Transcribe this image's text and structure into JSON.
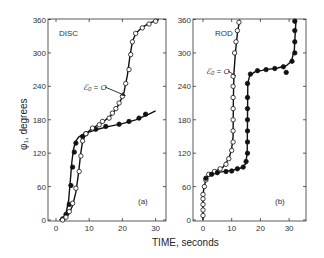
{
  "chart_data": [
    {
      "type": "line",
      "panel": "(a)",
      "title": "DISC",
      "annotation": "ℰ₀ = O",
      "xlabel": "TIME, seconds",
      "ylabel": "φ₁, degrees",
      "xlim": [
        0,
        33
      ],
      "ylim": [
        0,
        360
      ],
      "xticks": [
        0,
        10,
        20,
        30
      ],
      "yticks": [
        0,
        60,
        120,
        180,
        240,
        300,
        360
      ],
      "grid": false,
      "series": [
        {
          "name": "filled",
          "marker": "filled-circle",
          "x": [
            2,
            3,
            4,
            4.5,
            5,
            5.5,
            6,
            8,
            9,
            12,
            15,
            19,
            22,
            25,
            27
          ],
          "y": [
            2,
            10,
            28,
            62,
            95,
            122,
            138,
            150,
            155,
            163,
            168,
            172,
            177,
            183,
            190
          ],
          "curve_x": [
            1,
            2,
            3,
            3.8,
            4.3,
            4.8,
            5.3,
            6,
            7,
            9,
            12,
            16,
            20,
            24,
            28,
            30
          ],
          "curve_y": [
            0,
            3,
            12,
            35,
            70,
            105,
            128,
            142,
            150,
            156,
            162,
            168,
            173,
            180,
            190,
            196
          ]
        },
        {
          "name": "E0 = 0 (open)",
          "marker": "open-circle",
          "x": [
            2,
            3,
            4,
            5,
            6,
            7,
            7.5,
            8,
            9,
            11,
            13,
            14,
            16,
            17,
            18,
            19,
            20,
            21,
            22,
            22.5,
            23,
            24,
            26,
            28,
            30
          ],
          "y": [
            0,
            5,
            15,
            30,
            57,
            87,
            115,
            142,
            155,
            165,
            171,
            177,
            183,
            192,
            200,
            210,
            222,
            245,
            270,
            297,
            320,
            335,
            345,
            352,
            357
          ],
          "curve_x": [
            2,
            3,
            4,
            5,
            6,
            6.8,
            7.4,
            8,
            9,
            11,
            14,
            17,
            19,
            20.5,
            21.5,
            22.3,
            23,
            24,
            26,
            28,
            30,
            31
          ],
          "curve_y": [
            0,
            4,
            12,
            26,
            50,
            85,
            118,
            142,
            155,
            165,
            175,
            190,
            208,
            230,
            260,
            295,
            320,
            335,
            346,
            353,
            358,
            360
          ]
        }
      ]
    },
    {
      "type": "line",
      "panel": "(b)",
      "title": "ROD",
      "annotation": "ℰ₀ = O",
      "xlabel": "TIME, seconds",
      "ylabel": "",
      "xlim": [
        -3,
        36
      ],
      "ylim": [
        0,
        360
      ],
      "xticks": [
        0,
        10,
        20,
        30
      ],
      "yticks": [
        0,
        60,
        120,
        180,
        240,
        300,
        360
      ],
      "grid": false,
      "series": [
        {
          "name": "E0 = 0 (open)",
          "marker": "open-circle",
          "x": [
            0,
            0,
            0,
            0,
            0,
            0.5,
            1,
            2,
            4,
            6,
            8,
            9,
            10,
            10.5,
            10.5,
            10.5,
            10.5,
            10.5,
            10.5,
            10.5,
            11,
            11.5,
            12,
            12.5
          ],
          "y": [
            8,
            18,
            28,
            38,
            46,
            60,
            72,
            82,
            87,
            92,
            100,
            110,
            125,
            140,
            160,
            180,
            200,
            220,
            240,
            258,
            300,
            320,
            340,
            355
          ],
          "curve_x": [
            0,
            0,
            0.4,
            1,
            2,
            4,
            7,
            9,
            10,
            10.5,
            10.6,
            10.8,
            11.3,
            12,
            12.8
          ],
          "curve_y": [
            0,
            45,
            60,
            72,
            82,
            87,
            95,
            110,
            128,
            150,
            220,
            265,
            300,
            335,
            360
          ]
        },
        {
          "name": "filled",
          "marker": "filled-circle",
          "x": [
            1,
            3,
            5,
            8,
            10,
            12,
            14,
            15,
            15.5,
            15.5,
            15.5,
            15.5,
            15.5,
            15.5,
            15.5,
            16.5,
            19,
            22,
            25,
            28,
            29,
            31,
            32,
            32,
            32,
            32
          ],
          "y": [
            75,
            82,
            85,
            87,
            88,
            92,
            95,
            105,
            120,
            140,
            160,
            180,
            200,
            220,
            245,
            262,
            268,
            270,
            272,
            275,
            265,
            285,
            300,
            320,
            340,
            357
          ],
          "curve_x": [
            1,
            3,
            6,
            10,
            13,
            14.8,
            15.4,
            15.5,
            15.6,
            16.2,
            18,
            22,
            26,
            29,
            30.8,
            31.8,
            32.2,
            32.4
          ],
          "curve_y": [
            75,
            82,
            86,
            89,
            93,
            100,
            120,
            180,
            245,
            258,
            266,
            270,
            273,
            277,
            285,
            305,
            340,
            360
          ]
        }
      ]
    }
  ],
  "labels": {
    "disc": "DISC",
    "rod": "ROD",
    "panel_a": "(a)",
    "panel_b": "(b)",
    "annotation_a": "ℰ₀ = O",
    "annotation_b": "ℰ₀ = O",
    "ylabel": "φ₁, degrees",
    "xlabel": "TIME, seconds"
  }
}
